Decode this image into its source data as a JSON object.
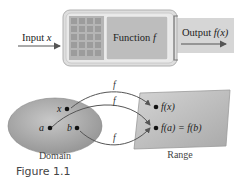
{
  "machine": {
    "input_label": "Input",
    "input_var": "x",
    "function_label": "Function",
    "function_var": "f",
    "output_label": "Output",
    "output_expr": "f(x)"
  },
  "mapping": {
    "domain_label": "Domain",
    "range_label": "Range",
    "domain_points": [
      "x",
      "a",
      "b"
    ],
    "range_points": [
      "f(x)",
      "f(a) = f(b)"
    ],
    "arrow_labels": [
      "f",
      "f",
      "f"
    ]
  },
  "caption": "Figure 1.1",
  "colors": {
    "machine_outer": "#d9d9d9",
    "machine_panel": "#b8b8b8",
    "grid_cell": "#9a9a9a",
    "output_tab": "#d3d3d3",
    "domain_fill": "#a8a8a8",
    "range_fill": "#bcbcbc",
    "arrow": "#555555"
  }
}
